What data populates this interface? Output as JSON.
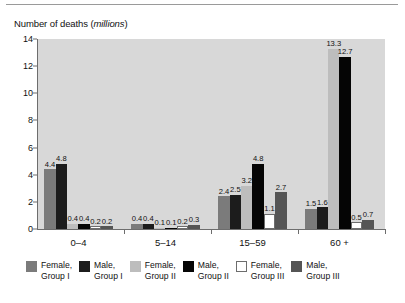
{
  "chart_data": {
    "type": "bar",
    "title": "Number of deaths (millions)",
    "title_main": "Number of deaths (",
    "title_unit": "millions",
    "title_close": ")",
    "xlabel": "",
    "ylabel": "Number of deaths (millions)",
    "ylim": [
      0,
      14
    ],
    "yticks": [
      0,
      2,
      4,
      6,
      8,
      10,
      12,
      14
    ],
    "grid": false,
    "legend_position": "bottom",
    "categories": [
      "0–4",
      "5–14",
      "15–59",
      "60 +"
    ],
    "series": [
      {
        "name": "Female, Group I",
        "label_line1": "Female,",
        "label_line2": "Group I",
        "color": "#7b7b7b",
        "values": [
          4.4,
          0.4,
          2.4,
          1.5
        ]
      },
      {
        "name": "Male, Group I",
        "label_line1": "Male,",
        "label_line2": "Group I",
        "color": "#1c1c1c",
        "values": [
          4.8,
          0.4,
          2.5,
          1.6
        ]
      },
      {
        "name": "Female, Group II",
        "label_line1": "Female,",
        "label_line2": "Group II",
        "color": "#bdbdbd",
        "values": [
          0.4,
          0.1,
          3.2,
          13.3
        ]
      },
      {
        "name": "Male, Group II",
        "label_line1": "Male,",
        "label_line2": "Group II",
        "color": "#050505",
        "values": [
          0.4,
          0.1,
          4.8,
          12.7
        ]
      },
      {
        "name": "Female, Group III",
        "label_line1": "Female,",
        "label_line2": "Group III",
        "color": "#ffffff",
        "values": [
          0.2,
          0.2,
          1.1,
          0.5
        ]
      },
      {
        "name": "Male, Group III",
        "label_line1": "Male,",
        "label_line2": "Group III",
        "color": "#555555",
        "values": [
          0.2,
          0.3,
          2.7,
          0.7
        ]
      }
    ],
    "value_labels": {
      "0–4": [
        "4.4",
        "4.8",
        "0.4",
        "0.4",
        "0.2",
        "0.2"
      ],
      "5–14": [
        "0.4",
        "0.4",
        "0.1",
        "0.1",
        "0.2",
        "0.3"
      ],
      "15–59": [
        "2.4",
        "2.5",
        "3.2",
        "4.8",
        "1.1",
        "2.7"
      ],
      "60 +": [
        "1.5",
        "1.6",
        "13.3",
        "12.7",
        "0.5",
        "0.7"
      ]
    },
    "colors": {
      "plot_background": "#d8d8d8",
      "axis": "#6d6d6d",
      "page_background": "#ffffff",
      "text": "#111111"
    }
  }
}
